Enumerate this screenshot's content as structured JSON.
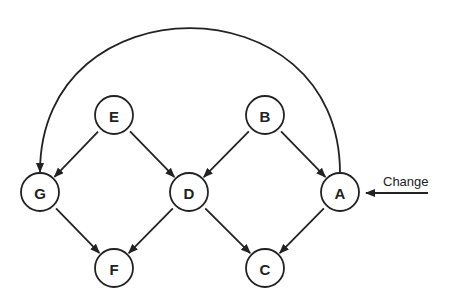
{
  "diagram": {
    "type": "directed-graph",
    "nodes": [
      {
        "id": "E",
        "label": "E",
        "x": 114,
        "y": 115
      },
      {
        "id": "B",
        "label": "B",
        "x": 265,
        "y": 115
      },
      {
        "id": "G",
        "label": "G",
        "x": 40,
        "y": 192
      },
      {
        "id": "D",
        "label": "D",
        "x": 189,
        "y": 192
      },
      {
        "id": "A",
        "label": "A",
        "x": 340,
        "y": 192
      },
      {
        "id": "F",
        "label": "F",
        "x": 114,
        "y": 268
      },
      {
        "id": "C",
        "label": "C",
        "x": 265,
        "y": 268
      }
    ],
    "edges": [
      {
        "from": "E",
        "to": "G"
      },
      {
        "from": "E",
        "to": "D"
      },
      {
        "from": "B",
        "to": "D"
      },
      {
        "from": "B",
        "to": "A"
      },
      {
        "from": "G",
        "to": "F"
      },
      {
        "from": "D",
        "to": "F"
      },
      {
        "from": "D",
        "to": "C"
      },
      {
        "from": "A",
        "to": "C"
      },
      {
        "from": "A",
        "to": "G",
        "style": "arc-over-top"
      }
    ],
    "input_arrow": {
      "label": "Change",
      "target": "A"
    }
  }
}
